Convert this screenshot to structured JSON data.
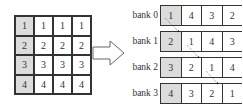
{
  "matrix": {
    "rows": [
      [
        "1",
        "1",
        "1",
        "1"
      ],
      [
        "2",
        "2",
        "2",
        "2"
      ],
      [
        "3",
        "3",
        "3",
        "3"
      ],
      [
        "4",
        "4",
        "4",
        "4"
      ]
    ],
    "highlight_column": 0
  },
  "banks": [
    {
      "label": "bank 0",
      "cells": [
        "1",
        "4",
        "3",
        "2"
      ],
      "highlight": 0
    },
    {
      "label": "bank 1",
      "cells": [
        "2",
        "1",
        "4",
        "3"
      ],
      "highlight": 0
    },
    {
      "label": "bank 2",
      "cells": [
        "3",
        "2",
        "1",
        "4"
      ],
      "highlight": 0
    },
    {
      "label": "bank 3",
      "cells": [
        "4",
        "3",
        "2",
        "1"
      ],
      "highlight": 0
    }
  ],
  "colors": {
    "highlight": "#dcdcdc",
    "line": "#333333"
  }
}
